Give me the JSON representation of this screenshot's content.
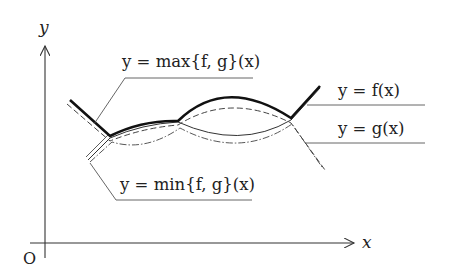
{
  "diagram": {
    "title": "",
    "axes": {
      "x_label": "x",
      "y_label": "y",
      "origin_label": "O"
    },
    "curves": [
      {
        "id": "max",
        "label": "y = max{f, g}(x)",
        "style": "thick solid"
      },
      {
        "id": "f",
        "label": "y = f(x)",
        "style": "dashed"
      },
      {
        "id": "g",
        "label": "y = g(x)",
        "style": "thin solid"
      },
      {
        "id": "min",
        "label": "y = min{f, g}(x)",
        "style": "dash-dot"
      }
    ],
    "labels": {
      "max": "y = max{f, g}(x)",
      "f": "y = f(x)",
      "g": "y = g(x)",
      "min": "y = min{f, g}(x)"
    },
    "colors": {
      "line": "#222222",
      "guide": "#555555",
      "background": "#ffffff"
    }
  }
}
